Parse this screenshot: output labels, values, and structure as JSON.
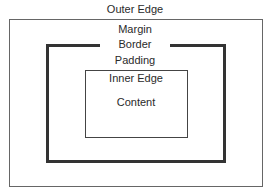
{
  "diagram": {
    "labels": {
      "outer_edge": "Outer Edge",
      "margin": "Margin",
      "border": "Border",
      "padding": "Padding",
      "inner_edge": "Inner Edge",
      "content": "Content"
    },
    "colors": {
      "outer_line": "#666666",
      "border_line": "#333333",
      "inner_line": "#444444",
      "text": "#2a2a2a",
      "background": "#ffffff"
    }
  }
}
